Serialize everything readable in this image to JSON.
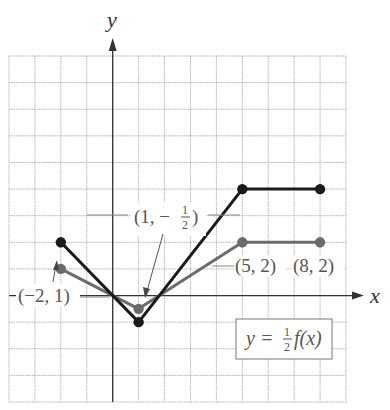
{
  "chart_data": {
    "type": "line",
    "title": "",
    "xlabel": "x",
    "ylabel": "y",
    "xlim": [
      -4,
      9
    ],
    "ylim": [
      -4,
      9
    ],
    "grid": true,
    "series": [
      {
        "name": "y = f(x)",
        "color": "#1a1a1a",
        "points": [
          [
            -2,
            2
          ],
          [
            1,
            -1
          ],
          [
            5,
            4
          ],
          [
            8,
            4
          ]
        ]
      },
      {
        "name": "y = 1/2 f(x)",
        "color": "#6b6b6b",
        "points": [
          [
            -2,
            1
          ],
          [
            1,
            -0.5
          ],
          [
            5,
            2
          ],
          [
            8,
            2
          ]
        ]
      }
    ],
    "annotations": [
      {
        "text": "(-2, 1)",
        "point": [
          -2,
          1
        ]
      },
      {
        "text": "(1, -1/2)",
        "point": [
          1,
          -0.5
        ]
      },
      {
        "text": "(5, 2)",
        "point": [
          5,
          2
        ]
      },
      {
        "text": "(8, 2)",
        "point": [
          8,
          2
        ]
      }
    ],
    "legend_box": "y = 1/2 f(x)"
  },
  "labels": {
    "x_axis": "x",
    "y_axis": "y",
    "pt_neg2_1": "(−2, 1)",
    "pt_1_half_prefix": "(1, −",
    "pt_1_half_num": "1",
    "pt_1_half_den": "2",
    "pt_1_half_suffix": ")",
    "pt_5_2": "(5, 2)",
    "pt_8_2": "(8, 2)",
    "eq_prefix": "y = ",
    "eq_num": "1",
    "eq_den": "2",
    "eq_suffix": "f(x)"
  },
  "colors": {
    "grid": "#b5b5b5",
    "axis": "#333333",
    "f_curve": "#1a1a1a",
    "half_curve": "#6b6b6b",
    "label": "#555555"
  }
}
